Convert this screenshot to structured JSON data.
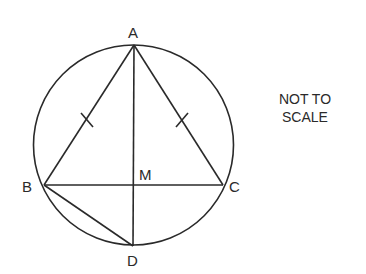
{
  "diagram": {
    "type": "geometry",
    "points": {
      "A": {
        "label": "A",
        "x": 134,
        "y": 45
      },
      "B": {
        "label": "B",
        "x": 44,
        "y": 185
      },
      "C": {
        "label": "C",
        "x": 223,
        "y": 185
      },
      "D": {
        "label": "D",
        "x": 133,
        "y": 246
      },
      "M": {
        "label": "M",
        "x": 134,
        "y": 185
      }
    },
    "circle": {
      "cx": 133.5,
      "cy": 145,
      "r": 100
    },
    "segments": [
      "AB",
      "AC",
      "BC",
      "AD",
      "BD"
    ],
    "equal_marks": [
      "AB",
      "AC"
    ],
    "note_lines": [
      "NOT TO",
      "SCALE"
    ],
    "stroke_color": "#2a2a2a"
  }
}
